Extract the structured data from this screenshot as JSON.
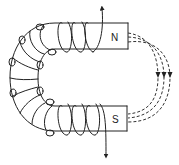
{
  "diagram": {
    "poles": {
      "north_label": "N",
      "south_label": "S"
    },
    "coil": {
      "current_in_direction": "up (top lead)",
      "current_out_direction": "down (bottom lead)"
    },
    "field_lines": {
      "count": 3,
      "style": "dashed",
      "direction": "from N to S (arrows pointing down)"
    },
    "colors": {
      "stroke": "#222222",
      "background": "#ffffff"
    }
  }
}
